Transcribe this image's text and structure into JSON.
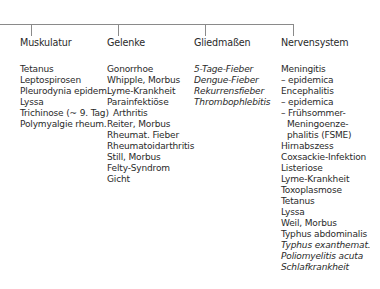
{
  "tree": {
    "line_color": "#8a8a8a",
    "text_color": "#2a2a2a"
  },
  "columns": [
    {
      "heading": "Muskulatur",
      "items": [
        {
          "text": "Tetanus",
          "italic": false,
          "indent": false
        },
        {
          "text": "Leptospirosen",
          "italic": false,
          "indent": false
        },
        {
          "text": "Pleurodynia epidem.",
          "italic": false,
          "indent": false
        },
        {
          "text": "Lyssa",
          "italic": false,
          "indent": false
        },
        {
          "text": "Trichinose (~ 9. Tag)",
          "italic": false,
          "indent": false
        },
        {
          "text": "Polymyalgie rheum.",
          "italic": false,
          "indent": false
        }
      ]
    },
    {
      "heading": "Gelenke",
      "items": [
        {
          "text": "Gonorrhoe",
          "italic": false,
          "indent": false
        },
        {
          "text": "Whipple, Morbus",
          "italic": false,
          "indent": false
        },
        {
          "text": "Lyme-Krankheit",
          "italic": false,
          "indent": false
        },
        {
          "text": "Parainfektiöse",
          "italic": false,
          "indent": false
        },
        {
          "text": "Arthritis",
          "italic": false,
          "indent": true
        },
        {
          "text": "Reiter, Morbus",
          "italic": false,
          "indent": false
        },
        {
          "text": "Rheumat. Fieber",
          "italic": false,
          "indent": false
        },
        {
          "text": "Rheumatoidarthritis",
          "italic": false,
          "indent": false
        },
        {
          "text": "Still, Morbus",
          "italic": false,
          "indent": false
        },
        {
          "text": "Felty-Syndrom",
          "italic": false,
          "indent": false
        },
        {
          "text": "Gicht",
          "italic": false,
          "indent": false
        }
      ]
    },
    {
      "heading": "Gliedmaßen",
      "items": [
        {
          "text": "5-Tage-Fieber",
          "italic": true,
          "indent": false
        },
        {
          "text": "Dengue-Fieber",
          "italic": true,
          "indent": false
        },
        {
          "text": "Rekurrensfieber",
          "italic": true,
          "indent": false
        },
        {
          "text": "Thrombophlebitis",
          "italic": true,
          "indent": false
        }
      ]
    },
    {
      "heading": "Nervensystem",
      "items": [
        {
          "text": "Meningitis",
          "italic": false,
          "indent": false
        },
        {
          "text": "– epidemica",
          "italic": false,
          "indent": false
        },
        {
          "text": "Encephalitis",
          "italic": false,
          "indent": false
        },
        {
          "text": "– epidemica",
          "italic": false,
          "indent": false
        },
        {
          "text": "– Frühsommer-",
          "italic": false,
          "indent": false
        },
        {
          "text": "Meningoenze-",
          "italic": false,
          "indent": true
        },
        {
          "text": "phalitis (FSME)",
          "italic": false,
          "indent": true
        },
        {
          "text": "Hirnabszess",
          "italic": false,
          "indent": false
        },
        {
          "text": "Coxsackie-Infektion",
          "italic": false,
          "indent": false
        },
        {
          "text": "Listeriose",
          "italic": false,
          "indent": false
        },
        {
          "text": "Lyme-Krankheit",
          "italic": false,
          "indent": false
        },
        {
          "text": "Toxoplasmose",
          "italic": false,
          "indent": false
        },
        {
          "text": "Tetanus",
          "italic": false,
          "indent": false
        },
        {
          "text": "Lyssa",
          "italic": false,
          "indent": false
        },
        {
          "text": "Weil, Morbus",
          "italic": false,
          "indent": false
        },
        {
          "text": "Typhus abdominalis",
          "italic": false,
          "indent": false
        },
        {
          "text": "Typhus exanthemat.",
          "italic": true,
          "indent": false
        },
        {
          "text": "Poliomyelitis acuta",
          "italic": true,
          "indent": false
        },
        {
          "text": "Schlafkrankheit",
          "italic": true,
          "indent": false
        }
      ]
    }
  ]
}
